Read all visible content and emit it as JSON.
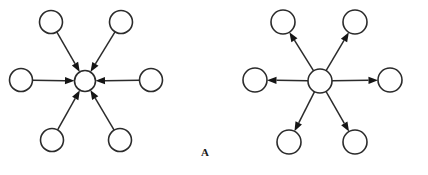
{
  "figure": {
    "caption": "A",
    "caption_position": {
      "x": 201,
      "y": 146
    },
    "background_color": "#ffffff",
    "stroke_color": "#2b2b2b",
    "arrow_fill_color": "#151515",
    "node_fill_color": "#ffffff",
    "width": 428,
    "height": 175
  },
  "diagrams": [
    {
      "name": "converging-star-graph",
      "direction": "inward",
      "hub": {
        "name": "hub-node",
        "cx": 85,
        "cy": 81,
        "r": 10.5
      },
      "peripheral_nodes": [
        {
          "name": "node-top-left",
          "cx": 51,
          "cy": 22,
          "r": 11.5
        },
        {
          "name": "node-top-right",
          "cx": 121,
          "cy": 22,
          "r": 11.5
        },
        {
          "name": "node-left",
          "cx": 21,
          "cy": 80,
          "r": 11.5
        },
        {
          "name": "node-right",
          "cx": 151,
          "cy": 80,
          "r": 11.5
        },
        {
          "name": "node-bottom-left",
          "cx": 52,
          "cy": 140,
          "r": 11.5
        },
        {
          "name": "node-bottom-right",
          "cx": 120,
          "cy": 140,
          "r": 11.5
        }
      ],
      "edges": [
        {
          "from": "node-top-left",
          "to": "hub-node",
          "arrow_at": "hub-node"
        },
        {
          "from": "node-top-right",
          "to": "hub-node",
          "arrow_at": "hub-node"
        },
        {
          "from": "node-left",
          "to": "hub-node",
          "arrow_at": "hub-node"
        },
        {
          "from": "node-right",
          "to": "hub-node",
          "arrow_at": "hub-node"
        },
        {
          "from": "node-bottom-left",
          "to": "hub-node",
          "arrow_at": "hub-node"
        },
        {
          "from": "node-bottom-right",
          "to": "hub-node",
          "arrow_at": "hub-node"
        }
      ]
    },
    {
      "name": "diverging-star-graph",
      "direction": "outward",
      "hub": {
        "name": "hub-node",
        "cx": 320,
        "cy": 81,
        "r": 12
      },
      "peripheral_nodes": [
        {
          "name": "node-top-left",
          "cx": 283,
          "cy": 22,
          "r": 12
        },
        {
          "name": "node-top-right",
          "cx": 355,
          "cy": 22,
          "r": 12
        },
        {
          "name": "node-left",
          "cx": 255,
          "cy": 80,
          "r": 12
        },
        {
          "name": "node-right",
          "cx": 390,
          "cy": 80,
          "r": 12
        },
        {
          "name": "node-bottom-left",
          "cx": 289,
          "cy": 142,
          "r": 12
        },
        {
          "name": "node-bottom-right",
          "cx": 355,
          "cy": 142,
          "r": 12
        }
      ],
      "edges": [
        {
          "from": "hub-node",
          "to": "node-top-left",
          "arrow_at": "node-top-left"
        },
        {
          "from": "hub-node",
          "to": "node-top-right",
          "arrow_at": "node-top-right"
        },
        {
          "from": "hub-node",
          "to": "node-left",
          "arrow_at": "node-left"
        },
        {
          "from": "hub-node",
          "to": "node-right",
          "arrow_at": "node-right"
        },
        {
          "from": "hub-node",
          "to": "node-bottom-left",
          "arrow_at": "node-bottom-left"
        },
        {
          "from": "hub-node",
          "to": "node-bottom-right",
          "arrow_at": "node-bottom-right"
        }
      ]
    }
  ]
}
